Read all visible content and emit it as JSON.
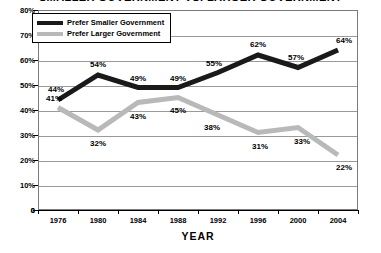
{
  "chart_data": {
    "type": "line",
    "title": "SMALLER GOVERNMENT VS. LARGER GOVERNMENT",
    "xlabel": "YEAR",
    "ylabel": "",
    "categories": [
      "1976",
      "1980",
      "1984",
      "1988",
      "1992",
      "1996",
      "2000",
      "2004"
    ],
    "ylim": [
      0,
      80
    ],
    "yticks": [
      "0",
      "10%",
      "20%",
      "30%",
      "40%",
      "50%",
      "60%",
      "70%",
      "80%"
    ],
    "ytick_values": [
      0,
      10,
      20,
      30,
      40,
      50,
      60,
      70,
      80
    ],
    "grid": true,
    "legend_position": "top-left",
    "series": [
      {
        "name": "Prefer Smaller Government",
        "color": "#1a1a1a",
        "values": [
          44,
          54,
          49,
          49,
          55,
          62,
          57,
          64
        ],
        "labels": [
          "44%",
          "54%",
          "49%",
          "49%",
          "55%",
          "62%",
          "57%",
          "64%"
        ]
      },
      {
        "name": "Prefer Larger Government",
        "color": "#b9b9b9",
        "values": [
          41,
          32,
          43,
          45,
          38,
          31,
          33,
          22
        ],
        "labels": [
          "41%",
          "32%",
          "43%",
          "45%",
          "38%",
          "31%",
          "33%",
          "22%"
        ]
      }
    ]
  },
  "colors": {
    "smaller_government": "#1a1a1a",
    "larger_government": "#b9b9b9",
    "gridline": "#9a9a9a",
    "frame": "#7a7a7a",
    "axis": "#000000",
    "background": "#ffffff"
  }
}
